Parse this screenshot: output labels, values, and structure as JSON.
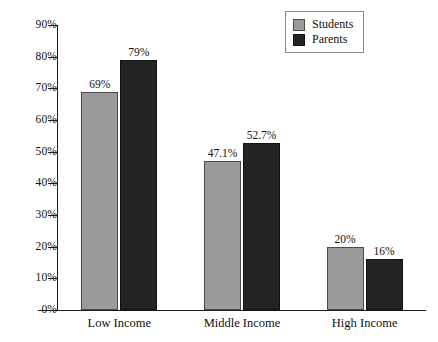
{
  "chart_data": {
    "type": "bar",
    "title": "",
    "subtitle": "",
    "xlabel": "",
    "ylabel": "",
    "ylim": [
      0,
      90
    ],
    "ytick_step": 10,
    "grid": false,
    "legend_position": "top-right",
    "categories": [
      "Low Income",
      "Middle Income",
      "High Income"
    ],
    "ytick_labels": [
      "0%",
      "10%",
      "20%",
      "30%",
      "40%",
      "50%",
      "60%",
      "70%",
      "80%",
      "90%"
    ],
    "ytick_values": [
      0,
      10,
      20,
      30,
      40,
      50,
      60,
      70,
      80,
      90
    ],
    "series": [
      {
        "name": "Students",
        "color": "#9b9b9b",
        "values": [
          69,
          47.1,
          20
        ],
        "labels": [
          "69%",
          "47.1%",
          "20%"
        ]
      },
      {
        "name": "Parents",
        "color": "#232323",
        "values": [
          79,
          52.7,
          16
        ],
        "labels": [
          "79%",
          "52.7%",
          "16%"
        ]
      }
    ]
  },
  "legend": {
    "entries": [
      {
        "label": "Students",
        "swatch": "students-swatch"
      },
      {
        "label": "Parents",
        "swatch": "parents-swatch"
      }
    ]
  },
  "axes": {
    "y_axis_name": "percentage-axis",
    "x_axis_name": "income-category-axis"
  }
}
